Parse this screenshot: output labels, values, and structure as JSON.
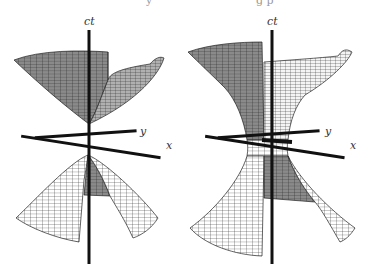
{
  "figure": {
    "top_fragments": [
      "y",
      "g p"
    ],
    "panels": [
      {
        "name": "two-sheeted-hyperboloid",
        "axes": {
          "vertical": "ct",
          "horizontal_1": "y",
          "horizontal_2": "x"
        }
      },
      {
        "name": "one-sheeted-hyperboloid",
        "axes": {
          "vertical": "ct",
          "horizontal_1": "y",
          "horizontal_2": "x"
        }
      }
    ]
  }
}
